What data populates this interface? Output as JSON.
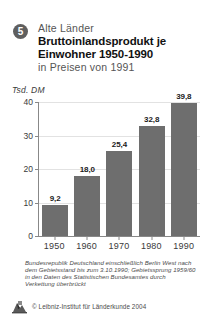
{
  "header": {
    "badge_number": "5",
    "kicker": "Alte Länder",
    "title_line_1": "Bruttoinlandsprodukt je",
    "title_line_2": "Einwohner 1950-1990",
    "subtitle": "in Preisen von 1991"
  },
  "footnote": {
    "text": "Bundesrepublik Deutschland einschließlich Berlin West nach dem Gebietsstand bis zum 3.10.1990; Gebietssprung 1959/60 in den Daten des Statistischen Bundesamtes durch Verkettung überbrückt"
  },
  "footer": {
    "copyright": "© Leibniz-Institut für Länderkunde 2004",
    "logo_name": "leibniz-institut-logo"
  },
  "colors": {
    "bar": "#6e6e6e",
    "axis": "#888888",
    "grid": "#e2e2e2",
    "badge": "#5f5f5f",
    "text": "#1a1a1a",
    "muted": "#555555"
  },
  "chart_data": {
    "type": "bar",
    "title": "Bruttoinlandsprodukt je Einwohner 1950-1990",
    "subtitle": "in Preisen von 1991",
    "region": "Alte Länder",
    "xlabel": "",
    "ylabel": "Tsd. DM",
    "unit_label": "Tsd. DM",
    "categories": [
      "1950",
      "1960",
      "1970",
      "1980",
      "1990"
    ],
    "values": [
      9.2,
      18.0,
      25.4,
      32.8,
      39.8
    ],
    "value_labels": [
      "9,2",
      "18,0",
      "25,4",
      "32,8",
      "39,8"
    ],
    "ylim": [
      0,
      40
    ],
    "yticks": [
      0,
      10,
      20,
      30,
      40
    ],
    "ytick_labels": [
      "0",
      "10",
      "20",
      "30",
      "40"
    ],
    "grid": true,
    "legend": false,
    "note": "Bundesrepublik Deutschland einschließlich Berlin West nach dem Gebietsstand bis zum 3.10.1990; Gebietssprung 1959/60 in den Daten des Statistischen Bundesamtes durch Verkettung überbrückt"
  }
}
